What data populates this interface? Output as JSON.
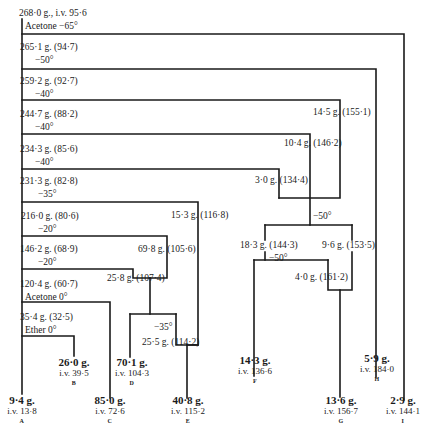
{
  "root": {
    "label": "268·0 g., i.v. 95·6",
    "step": "Acetone −65°"
  },
  "main_chain": [
    {
      "id": "n1",
      "label": "265·1 g. (94·7)",
      "step": "−50°"
    },
    {
      "id": "n2",
      "label": "259·2 g. (92·7)",
      "step": "−40°"
    },
    {
      "id": "n3",
      "label": "244·7 g. (88·2)",
      "step": "−40°"
    },
    {
      "id": "n4",
      "label": "234·3 g. (85·6)",
      "step": "−40°"
    },
    {
      "id": "n5",
      "label": "231·3 g. (82·8)",
      "step": "−35°"
    },
    {
      "id": "n6",
      "label": "216·0 g. (80·6)",
      "step": "−20°"
    },
    {
      "id": "n7",
      "label": "146·2 g. (68·9)",
      "step": "−20°"
    },
    {
      "id": "n8",
      "label": "120·4 g. (60·7)",
      "step": "Acetone 0°"
    },
    {
      "id": "n9",
      "label": "35·4 g. (32·5)",
      "step": "Ether 0°"
    }
  ],
  "branch_nodes": {
    "b_14_5": "14·5 g. (155·1)",
    "b_10_4": "10·4 g. (146·2)",
    "b_3_0": "3·0 g. (134·4)",
    "b_15_3": "15·3 g. (116·8)",
    "b_69_8": "69·8 g. (105·6)",
    "b_25_8": "25·8 g. (107·4)",
    "b_25_5": "25·5 g. (114·2)",
    "b_18_3": "18·3 g. (144·3)",
    "b_9_6": "9·6 g. (153·5)",
    "b_4_0": "4·0 g. (161·2)",
    "step_minus35": "−35°",
    "step_minus50_a": "−50°",
    "step_minus50_b": "−50°"
  },
  "fractions": [
    {
      "letter": "A",
      "weight": "9·4 g.",
      "iv": "i.v. 13·8"
    },
    {
      "letter": "B",
      "weight": "26·0 g.",
      "iv": "i.v. 39·5"
    },
    {
      "letter": "C",
      "weight": "85·0 g.",
      "iv": "i.v. 72·6"
    },
    {
      "letter": "D",
      "weight": "70·1 g.",
      "iv": "i.v. 104·3"
    },
    {
      "letter": "E",
      "weight": "40·8 g.",
      "iv": "i.v. 115·2"
    },
    {
      "letter": "F",
      "weight": "14·3 g.",
      "iv": "i.v. 136·6"
    },
    {
      "letter": "G",
      "weight": "13·6 g.",
      "iv": "i.v. 156·7"
    },
    {
      "letter": "H",
      "weight": "5·9 g.",
      "iv": "i.v. 184·0"
    },
    {
      "letter": "I",
      "weight": "2·9 g.",
      "iv": "i.v. 144·1"
    }
  ],
  "colors": {
    "line": "#1a1a1a",
    "text": "#1a1a1a",
    "background": "#ffffff"
  }
}
